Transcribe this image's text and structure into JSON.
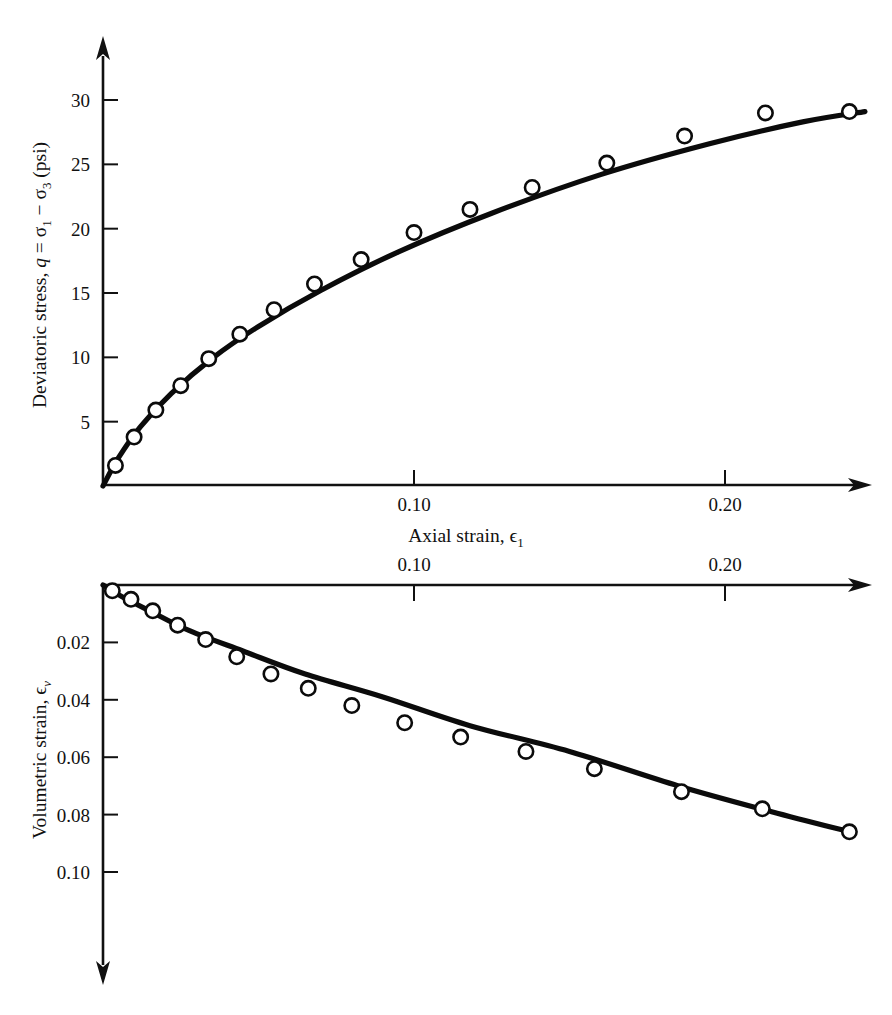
{
  "figure": {
    "name": "triaxial-test-curves",
    "background_color": "#ffffff",
    "ink_color": "#111111"
  },
  "upper_plot": {
    "name": "deviatoric-stress-vs-axial-strain",
    "y_axis_title_parts": {
      "lead": "Deviatoric stress, ",
      "q": "q",
      "equals": " = ",
      "sigma1": "σ",
      "sub1": "1",
      "minus": " − ",
      "sigma3": "σ",
      "sub3": "3",
      "units": " (psi)"
    },
    "y_axis_title_plain": "Deviatoric stress, q = σ1 − σ3 (psi)",
    "x_axis_title_parts": {
      "lead": "Axial strain, ",
      "epsilon": "ϵ",
      "sub": "1"
    },
    "x_axis_title_plain": "Axial strain, ϵ1",
    "y_tick_labels": [
      "30",
      "25",
      "20",
      "15",
      "10",
      "5"
    ],
    "y_tick_values": [
      30,
      25,
      20,
      15,
      10,
      5
    ],
    "x_tick_labels": [
      "0.10",
      "0.20"
    ],
    "x_tick_values": [
      0.1,
      0.2
    ]
  },
  "lower_plot": {
    "name": "volumetric-strain-vs-axial-strain",
    "y_axis_title_parts": {
      "lead": "Volumetric strain, ",
      "epsilon": "ϵ",
      "sub": "v"
    },
    "y_axis_title_plain": "Volumetric strain, ϵv",
    "x_axis_title_parts": {
      "lead": "Axial strain, ",
      "epsilon": "ϵ",
      "sub": "1"
    },
    "x_axis_title_plain": "Axial strain, ϵ1",
    "y_tick_labels": [
      "0.02",
      "0.04",
      "0.06",
      "0.08",
      "0.10"
    ],
    "y_tick_values": [
      0.02,
      0.04,
      0.06,
      0.08,
      0.1
    ],
    "x_tick_labels": [
      "0.10",
      "0.20"
    ],
    "x_tick_values": [
      0.1,
      0.2
    ]
  },
  "chart_data": [
    {
      "type": "scatter",
      "name": "deviatoric-stress-curve",
      "title": "",
      "xlabel": "Axial strain, ϵ1",
      "ylabel": "Deviatoric stress, q = σ1 − σ3 (psi)",
      "xlim": [
        0.0,
        0.252
      ],
      "ylim": [
        0.0,
        32.0
      ],
      "xticks": [
        0.1,
        0.2
      ],
      "xticklabels": [
        "0.10",
        "0.20"
      ],
      "yticks": [
        5,
        10,
        15,
        20,
        25,
        30
      ],
      "yticklabels": [
        "5",
        "10",
        "15",
        "20",
        "25",
        "30"
      ],
      "grid": false,
      "legend": null,
      "y_axis_direction": "up",
      "x_axis_direction": "right",
      "marker": "open-circle",
      "series": [
        {
          "name": "measured points",
          "x": [
            0.004,
            0.01,
            0.017,
            0.025,
            0.034,
            0.044,
            0.055,
            0.068,
            0.083,
            0.1,
            0.118,
            0.138,
            0.162,
            0.187,
            0.213,
            0.24
          ],
          "y": [
            1.6,
            3.8,
            5.9,
            7.8,
            9.9,
            11.8,
            13.7,
            15.7,
            17.6,
            19.7,
            21.5,
            23.2,
            25.1,
            27.2,
            29.0,
            29.1
          ]
        },
        {
          "name": "fitted hyperbolic curve",
          "x": [
            0.0,
            0.005,
            0.012,
            0.022,
            0.035,
            0.05,
            0.07,
            0.095,
            0.125,
            0.16,
            0.195,
            0.225,
            0.245
          ],
          "y": [
            0.0,
            2.2,
            4.6,
            7.2,
            9.9,
            12.4,
            15.2,
            18.2,
            21.2,
            24.2,
            26.6,
            28.3,
            29.1
          ]
        }
      ]
    },
    {
      "type": "scatter",
      "name": "volumetric-strain-curve",
      "title": "",
      "xlabel": "Axial strain, ϵ1",
      "ylabel": "Volumetric strain, ϵv",
      "xlim": [
        0.0,
        0.252
      ],
      "ylim": [
        0.0,
        0.115
      ],
      "xticks": [
        0.1,
        0.2
      ],
      "xticklabels": [
        "0.10",
        "0.20"
      ],
      "yticks": [
        0.02,
        0.04,
        0.06,
        0.08,
        0.1
      ],
      "yticklabels": [
        "0.02",
        "0.04",
        "0.06",
        "0.08",
        "0.10"
      ],
      "grid": false,
      "legend": null,
      "y_axis_direction": "down",
      "x_axis_direction": "right",
      "marker": "open-circle",
      "series": [
        {
          "name": "measured points",
          "x": [
            0.003,
            0.009,
            0.016,
            0.024,
            0.033,
            0.043,
            0.054,
            0.066,
            0.08,
            0.097,
            0.115,
            0.136,
            0.158,
            0.186,
            0.212,
            0.24
          ],
          "y": [
            0.002,
            0.005,
            0.009,
            0.014,
            0.019,
            0.025,
            0.031,
            0.036,
            0.042,
            0.048,
            0.053,
            0.058,
            0.064,
            0.072,
            0.078,
            0.086
          ]
        },
        {
          "name": "fitted curve",
          "x": [
            0.0,
            0.006,
            0.015,
            0.028,
            0.045,
            0.065,
            0.09,
            0.118,
            0.15,
            0.185,
            0.215,
            0.24
          ],
          "y": [
            0.0,
            0.004,
            0.009,
            0.016,
            0.023,
            0.031,
            0.039,
            0.049,
            0.058,
            0.07,
            0.079,
            0.086
          ]
        }
      ]
    }
  ]
}
